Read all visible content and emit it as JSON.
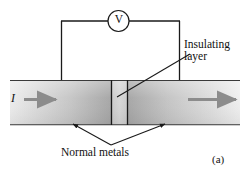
{
  "figure": {
    "panel_label": "(a)",
    "caption_labels": {
      "insulating_line1": "Insulating",
      "insulating_line2": "layer",
      "normal_metals": "Normal metals",
      "current": "I",
      "voltmeter": "V"
    },
    "colors": {
      "line": "#1a1a1a",
      "arrow_fill": "#8c8c8c",
      "slab_light": "#eeeeee",
      "slab_mid": "#c8c8c8",
      "slab_dark": "#a9a9a9",
      "background": "#ffffff"
    },
    "components": {
      "voltmeter_symbol": "V",
      "current_symbol": "I",
      "insulating_layer": "Insulating layer",
      "normal_metals": "Normal metals"
    }
  }
}
